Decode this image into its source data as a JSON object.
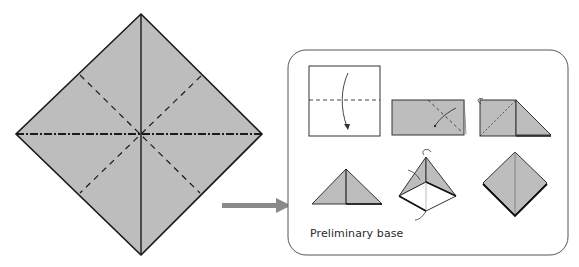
{
  "diagram": {
    "main_square": {
      "description": "Square rotated 45° showing crease pattern: solid valley diagonals, dashed book folds, dash-dot horizontal diagonal",
      "fill": "#bdbdbd",
      "stroke": "#1a1a1a"
    },
    "arrow": {
      "direction": "right",
      "color": "#8a8a8a"
    },
    "inset_panel": {
      "caption": "Preliminary base",
      "border_color": "#555555",
      "steps": [
        {
          "id": 1,
          "label": "Fold square in half along dashed line"
        },
        {
          "id": 2,
          "label": "Fold rectangle along diagonal dashed line"
        },
        {
          "id": 3,
          "label": "Turn over and fold diagonal"
        },
        {
          "id": 4,
          "label": "Triangle"
        },
        {
          "id": 5,
          "label": "Open and squash into pyramid"
        },
        {
          "id": 6,
          "label": "Completed preliminary base"
        }
      ]
    },
    "colors": {
      "paper": "#bdbdbd",
      "line": "#1a1a1a",
      "white": "#ffffff"
    }
  }
}
